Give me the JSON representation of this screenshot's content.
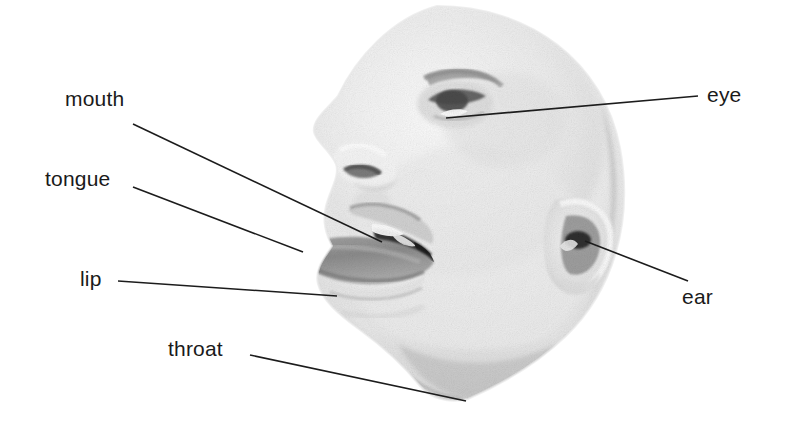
{
  "figure": {
    "kind": "labelled-anatomy-photo",
    "background_color": "#ffffff",
    "label_color": "#1a1a1a",
    "leader_line_color": "#1c1c1c",
    "photo_tone": "grayscale"
  },
  "labels": [
    {
      "id": "mouth",
      "text": "mouth",
      "text_x": 65,
      "text_y": 88,
      "line": {
        "x1": 133,
        "y1": 124,
        "x2": 382,
        "y2": 242
      }
    },
    {
      "id": "tongue",
      "text": "tongue",
      "text_x": 45,
      "text_y": 168,
      "line": {
        "x1": 133,
        "y1": 187,
        "x2": 303,
        "y2": 252
      }
    },
    {
      "id": "lip",
      "text": "lip",
      "text_x": 80,
      "text_y": 268,
      "line": {
        "x1": 118,
        "y1": 281,
        "x2": 337,
        "y2": 296
      }
    },
    {
      "id": "throat",
      "text": "throat",
      "text_x": 168,
      "text_y": 338,
      "line": {
        "x1": 250,
        "y1": 355,
        "x2": 466,
        "y2": 401
      }
    },
    {
      "id": "eye",
      "text": "eye",
      "text_x": 707,
      "text_y": 84,
      "line": {
        "x1": 698,
        "y1": 96,
        "x2": 446,
        "y2": 118
      }
    },
    {
      "id": "ear",
      "text": "ear",
      "text_x": 682,
      "text_y": 286,
      "line": {
        "x1": 688,
        "y1": 281,
        "x2": 585,
        "y2": 241
      }
    }
  ]
}
